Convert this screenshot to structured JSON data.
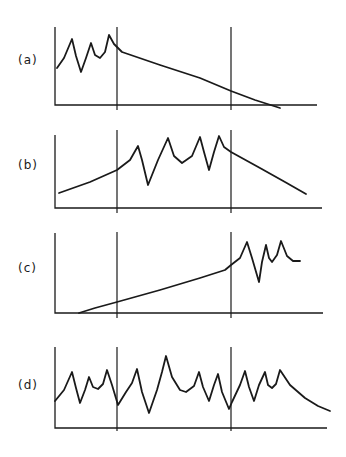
{
  "chart_data": [
    {
      "type": "line",
      "panel_label": "(a)",
      "title": "",
      "xlabel": "",
      "ylabel": "",
      "grid": false,
      "legend": null,
      "axis_box": {
        "x0": 55,
        "x1": 317,
        "y_top": 27,
        "y_base": 105
      },
      "dividers_x": [
        117,
        231
      ],
      "divider_extent": [
        27,
        110
      ],
      "points": [
        [
          57,
          68
        ],
        [
          64,
          58
        ],
        [
          72,
          39
        ],
        [
          76,
          56
        ],
        [
          81,
          72
        ],
        [
          86,
          58
        ],
        [
          91,
          43
        ],
        [
          95,
          55
        ],
        [
          100,
          58
        ],
        [
          105,
          52
        ],
        [
          109,
          35
        ],
        [
          114,
          44
        ],
        [
          122,
          52
        ],
        [
          160,
          65
        ],
        [
          200,
          78
        ],
        [
          231,
          91
        ],
        [
          255,
          100
        ],
        [
          280,
          108
        ]
      ]
    },
    {
      "type": "line",
      "panel_label": "(b)",
      "title": "",
      "xlabel": "",
      "ylabel": "",
      "grid": false,
      "legend": null,
      "axis_box": {
        "x0": 55,
        "x1": 322,
        "y_top": 135,
        "y_base": 208
      },
      "dividers_x": [
        117,
        231
      ],
      "divider_extent": [
        130,
        213
      ],
      "points": [
        [
          59,
          193
        ],
        [
          90,
          182
        ],
        [
          117,
          170
        ],
        [
          130,
          160
        ],
        [
          138,
          146
        ],
        [
          142,
          160
        ],
        [
          148,
          185
        ],
        [
          158,
          160
        ],
        [
          168,
          138
        ],
        [
          174,
          156
        ],
        [
          182,
          163
        ],
        [
          192,
          156
        ],
        [
          200,
          137
        ],
        [
          204,
          152
        ],
        [
          209,
          170
        ],
        [
          214,
          152
        ],
        [
          219,
          136
        ],
        [
          224,
          147
        ],
        [
          231,
          152
        ],
        [
          260,
          168
        ],
        [
          285,
          182
        ],
        [
          306,
          194
        ]
      ]
    },
    {
      "type": "line",
      "panel_label": "(c)",
      "title": "",
      "xlabel": "",
      "ylabel": "",
      "grid": false,
      "legend": null,
      "axis_box": {
        "x0": 55,
        "x1": 323,
        "y_top": 233,
        "y_base": 313
      },
      "dividers_x": [
        117,
        231
      ],
      "divider_extent": [
        232,
        318
      ],
      "points": [
        [
          79,
          313
        ],
        [
          95,
          308
        ],
        [
          117,
          302
        ],
        [
          160,
          290
        ],
        [
          200,
          278
        ],
        [
          225,
          270
        ],
        [
          231,
          265
        ],
        [
          240,
          258
        ],
        [
          247,
          242
        ],
        [
          252,
          258
        ],
        [
          259,
          282
        ],
        [
          262,
          262
        ],
        [
          266,
          245
        ],
        [
          269,
          258
        ],
        [
          272,
          262
        ],
        [
          277,
          255
        ],
        [
          281,
          241
        ],
        [
          287,
          256
        ],
        [
          293,
          261
        ],
        [
          300,
          261
        ]
      ]
    },
    {
      "type": "line",
      "panel_label": "(d)",
      "title": "",
      "xlabel": "",
      "ylabel": "",
      "grid": false,
      "legend": null,
      "axis_box": {
        "x0": 55,
        "x1": 327,
        "y_top": 347,
        "y_base": 428
      },
      "dividers_x": [
        117,
        231
      ],
      "divider_extent": [
        347,
        431
      ],
      "points": [
        [
          55,
          401
        ],
        [
          64,
          390
        ],
        [
          72,
          372
        ],
        [
          76,
          388
        ],
        [
          80,
          403
        ],
        [
          85,
          390
        ],
        [
          89,
          377
        ],
        [
          93,
          387
        ],
        [
          98,
          389
        ],
        [
          103,
          384
        ],
        [
          107,
          370
        ],
        [
          112,
          385
        ],
        [
          118,
          405
        ],
        [
          126,
          392
        ],
        [
          132,
          383
        ],
        [
          137,
          369
        ],
        [
          142,
          392
        ],
        [
          149,
          413
        ],
        [
          157,
          390
        ],
        [
          162,
          372
        ],
        [
          166,
          356
        ],
        [
          172,
          377
        ],
        [
          180,
          390
        ],
        [
          186,
          392
        ],
        [
          194,
          386
        ],
        [
          199,
          372
        ],
        [
          203,
          387
        ],
        [
          209,
          401
        ],
        [
          214,
          385
        ],
        [
          218,
          374
        ],
        [
          222,
          392
        ],
        [
          229,
          409
        ],
        [
          232,
          402
        ],
        [
          240,
          385
        ],
        [
          245,
          371
        ],
        [
          249,
          387
        ],
        [
          254,
          401
        ],
        [
          259,
          385
        ],
        [
          265,
          372
        ],
        [
          268,
          385
        ],
        [
          272,
          388
        ],
        [
          276,
          384
        ],
        [
          280,
          370
        ],
        [
          290,
          385
        ],
        [
          305,
          398
        ],
        [
          318,
          406
        ],
        [
          330,
          411
        ]
      ]
    }
  ],
  "labels": {
    "a": "(a)",
    "b": "(b)",
    "c": "(c)",
    "d": "(d)"
  }
}
